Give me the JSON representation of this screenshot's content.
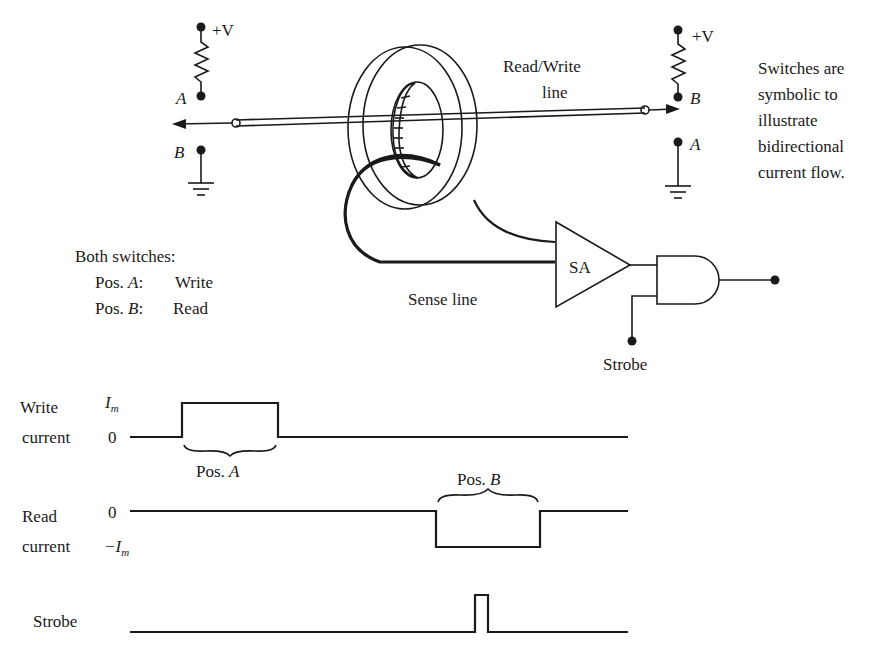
{
  "circuit": {
    "left_switch": {
      "supply_label": "+V",
      "upper_contact_label": "A",
      "lower_contact_label": "B"
    },
    "right_switch": {
      "supply_label": "+V",
      "upper_contact_label": "B",
      "lower_contact_label": "A"
    },
    "read_write_line_label": [
      "Read/Write",
      "line"
    ],
    "sense_line_label": "Sense line",
    "sense_amp_label": "SA",
    "strobe_label": "Strobe",
    "switch_note": [
      "Switches are",
      "symbolic to",
      "illustrate",
      "bidirectional",
      "current flow."
    ],
    "legend": {
      "title": "Both switches:",
      "rows": [
        {
          "pos": "Pos.",
          "letter": "A",
          "sep": ":",
          "meaning": "Write"
        },
        {
          "pos": "Pos.",
          "letter": "B",
          "sep": ":",
          "meaning": "Read"
        }
      ]
    }
  },
  "timing": {
    "write_current": {
      "label": [
        "Write",
        "current"
      ],
      "high_label_main": "I",
      "high_label_sub": "m",
      "zero_label": "0",
      "brace_label_prefix": "Pos.",
      "brace_label_letter": "A"
    },
    "read_current": {
      "label": [
        "Read",
        "current"
      ],
      "zero_label": "0",
      "low_label_prefix": "−I",
      "low_label_sub": "m",
      "brace_label_prefix": "Pos.",
      "brace_label_letter": "B"
    },
    "strobe": {
      "label": "Strobe"
    }
  }
}
